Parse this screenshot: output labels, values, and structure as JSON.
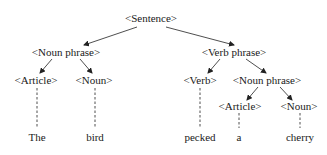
{
  "diagram": {
    "type": "parse-tree",
    "edge_color": "#222222",
    "nodes": {
      "sentence": "<Sentence>",
      "np1": "<Noun  phrase>",
      "vp": "<Verb  phrase>",
      "article1": "<Article>",
      "noun1": "<Noun>",
      "verb": "<Verb>",
      "np2": "<Noun  phrase>",
      "article2": "<Article>",
      "noun2": "<Noun>"
    },
    "words": {
      "w1": "The",
      "w2": "bird",
      "w3": "pecked",
      "w4": "a",
      "w5": "cherry"
    }
  }
}
